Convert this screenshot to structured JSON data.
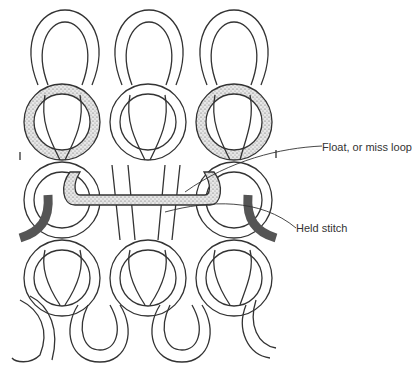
{
  "figure": {
    "rows": 4,
    "columns": 3
  },
  "labels": {
    "float": "Float, or miss loop",
    "held": "Held stitch"
  },
  "colors": {
    "stroke": "#333333",
    "yarn_fill": "#ffffff",
    "stipple": "#777777"
  }
}
